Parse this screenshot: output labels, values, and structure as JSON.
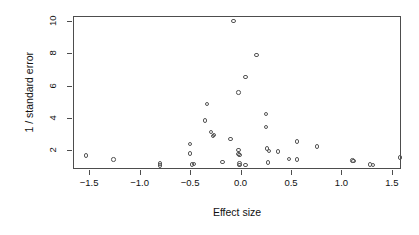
{
  "chart_data": {
    "type": "scatter",
    "title": "",
    "xlabel": "Effect size",
    "ylabel": "1 / standard error",
    "xlim": [
      -1.66,
      1.59
    ],
    "ylim": [
      0.85,
      10.3
    ],
    "xticks": [
      -1.5,
      -1.0,
      -0.5,
      0.0,
      0.5,
      1.0,
      1.5
    ],
    "xticklabels": [
      "-1.5",
      "-1.0",
      "-0.5",
      "0.0",
      "0.5",
      "1.0",
      "1.5"
    ],
    "yticks": [
      2,
      4,
      6,
      8,
      10
    ],
    "yticklabels": [
      "2",
      "4",
      "6",
      "8",
      "10"
    ],
    "grid": false,
    "legend": "none",
    "marker": "open-circle",
    "marker_color": "#555555",
    "box_color": "#4d4d4d",
    "background": "#ffffff",
    "n_points": 40,
    "points": [
      {
        "x": -1.53,
        "y": 1.68
      },
      {
        "x": -1.26,
        "y": 1.43
      },
      {
        "x": -0.8,
        "y": 1.18
      },
      {
        "x": -0.8,
        "y": 1.07
      },
      {
        "x": -0.5,
        "y": 2.38
      },
      {
        "x": -0.5,
        "y": 1.8
      },
      {
        "x": -0.48,
        "y": 1.13
      },
      {
        "x": -0.33,
        "y": 4.85
      },
      {
        "x": -0.35,
        "y": 3.85
      },
      {
        "x": -0.29,
        "y": 3.12
      },
      {
        "x": -0.27,
        "y": 2.9
      },
      {
        "x": -0.26,
        "y": 2.95
      },
      {
        "x": -0.18,
        "y": 1.28
      },
      {
        "x": -0.1,
        "y": 2.72
      },
      {
        "x": -0.07,
        "y": 9.98
      },
      {
        "x": -0.02,
        "y": 5.58
      },
      {
        "x": -0.02,
        "y": 2.02
      },
      {
        "x": -0.02,
        "y": 1.76
      },
      {
        "x": -0.01,
        "y": 1.7
      },
      {
        "x": -0.01,
        "y": 1.18
      },
      {
        "x": -0.01,
        "y": 1.08
      },
      {
        "x": 0.05,
        "y": 6.52
      },
      {
        "x": 0.16,
        "y": 7.88
      },
      {
        "x": 0.25,
        "y": 4.25
      },
      {
        "x": 0.25,
        "y": 3.45
      },
      {
        "x": 0.26,
        "y": 2.12
      },
      {
        "x": 0.28,
        "y": 1.98
      },
      {
        "x": 0.27,
        "y": 1.25
      },
      {
        "x": 0.37,
        "y": 1.92
      },
      {
        "x": 0.48,
        "y": 1.45
      },
      {
        "x": 0.56,
        "y": 2.55
      },
      {
        "x": 0.56,
        "y": 1.44
      },
      {
        "x": 0.76,
        "y": 2.25
      },
      {
        "x": 1.11,
        "y": 1.38
      },
      {
        "x": 1.12,
        "y": 1.34
      },
      {
        "x": 1.28,
        "y": 1.12
      },
      {
        "x": 1.31,
        "y": 1.1
      },
      {
        "x": 1.58,
        "y": 1.55
      },
      {
        "x": -0.46,
        "y": 1.15
      },
      {
        "x": 0.05,
        "y": 1.1
      }
    ]
  },
  "layout": {
    "plot_left": 73,
    "plot_top": 16,
    "plot_right": 401,
    "plot_bottom": 169
  }
}
